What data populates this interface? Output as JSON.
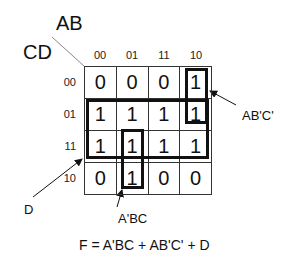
{
  "kmap": {
    "col_var": "AB",
    "row_var": "CD",
    "col_headers": [
      "00",
      "01",
      "11",
      "10"
    ],
    "row_headers": [
      "00",
      "01",
      "11",
      "10"
    ],
    "cells": [
      [
        "0",
        "0",
        "0",
        "1"
      ],
      [
        "1",
        "1",
        "1",
        "1"
      ],
      [
        "1",
        "1",
        "1",
        "1"
      ],
      [
        "0",
        "1",
        "0",
        "0"
      ]
    ]
  },
  "groups": {
    "d": {
      "label": "D"
    },
    "abc_prime": {
      "label": "AB'C'"
    },
    "a_prime_bc": {
      "label": "A'BC"
    }
  },
  "formula": "F = A'BC + AB'C' + D"
}
